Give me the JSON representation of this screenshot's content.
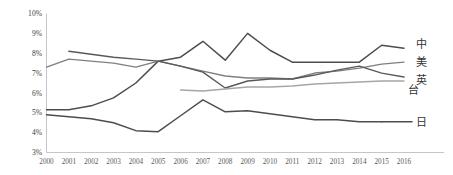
{
  "chart_data": {
    "type": "line",
    "title": "",
    "subtitle": "",
    "xlabel": "",
    "ylabel": "",
    "grid": false,
    "legend_position": "right-of-plot-inline",
    "x": [
      2000,
      2001,
      2002,
      2003,
      2004,
      2005,
      2006,
      2007,
      2008,
      2009,
      2010,
      2011,
      2012,
      2013,
      2014,
      2015,
      2016
    ],
    "xtick_labels": [
      "2000",
      "2001",
      "2002",
      "2003",
      "2004",
      "2005",
      "2006",
      "2007",
      "2008",
      "2009",
      "2010",
      "2011",
      "2012",
      "2013",
      "2014",
      "2015",
      "2016"
    ],
    "ytick_labels": [
      "3%",
      "4%",
      "5%",
      "6%",
      "7%",
      "8%",
      "9%",
      "10%"
    ],
    "ytick_values": [
      3,
      4,
      5,
      6,
      7,
      8,
      9,
      10
    ],
    "ylim": [
      3,
      10
    ],
    "xlim": [
      2000,
      2016
    ],
    "y_unit": "%",
    "series": [
      {
        "name": "中",
        "label": "中",
        "color": "#4d4d4d",
        "stroke_width": 1.5,
        "x_start": 2000,
        "values": [
          5.15,
          5.15,
          5.35,
          5.75,
          6.5,
          7.6,
          7.8,
          8.6,
          7.65,
          9.0,
          8.15,
          7.55,
          7.55,
          7.55,
          7.55,
          8.4,
          8.25
        ]
      },
      {
        "name": "美",
        "label": "美",
        "color": "#7f7f7f",
        "stroke_width": 1.4,
        "x_start": 2000,
        "values": [
          7.3,
          7.7,
          7.6,
          7.5,
          7.3,
          7.6,
          7.35,
          7.1,
          6.85,
          6.75,
          6.75,
          6.7,
          7.0,
          7.1,
          7.25,
          7.45,
          7.55
        ]
      },
      {
        "name": "英",
        "label": "英",
        "color": "#595959",
        "stroke_width": 1.4,
        "x_start": 2001,
        "values": [
          null,
          8.1,
          7.95,
          7.8,
          7.7,
          7.6,
          7.35,
          7.05,
          6.25,
          6.6,
          6.7,
          6.7,
          6.9,
          7.15,
          7.35,
          7.0,
          6.8
        ]
      },
      {
        "name": "台",
        "label": "台",
        "color": "#a6a6a6",
        "stroke_width": 1.4,
        "x_start": 2006,
        "values": [
          null,
          null,
          null,
          null,
          null,
          null,
          6.15,
          6.1,
          6.2,
          6.3,
          6.3,
          6.35,
          6.45,
          6.5,
          6.55,
          6.6,
          6.6
        ]
      },
      {
        "name": "日",
        "label": "日",
        "color": "#4d4d4d",
        "stroke_width": 1.5,
        "x_start": 2000,
        "values": [
          4.9,
          4.8,
          4.7,
          4.5,
          4.1,
          4.05,
          4.85,
          5.65,
          5.05,
          5.1,
          4.95,
          4.8,
          4.65,
          4.65,
          4.55,
          4.55,
          null
        ]
      }
    ],
    "series_end_labels": [
      {
        "name": "中",
        "text": "中",
        "y_value": 8.25
      },
      {
        "name": "美",
        "text": "美",
        "y_value": 7.55
      },
      {
        "name": "英",
        "text": "英",
        "y_value": 6.8
      },
      {
        "name": "台",
        "text": "台",
        "y_value": 6.6
      },
      {
        "name": "日",
        "text": "日",
        "y_value": 4.55
      }
    ]
  }
}
